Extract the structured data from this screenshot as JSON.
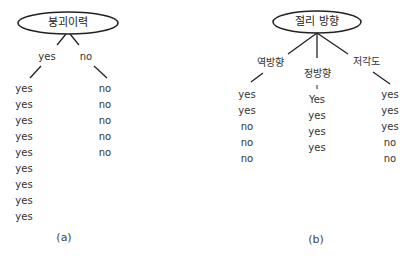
{
  "tree_a": {
    "root": "붕괴이력",
    "branches": [
      {
        "label": "yes",
        "values": [
          "yes",
          "yes",
          "yes",
          "yes",
          "yes",
          "yes",
          "yes",
          "yes",
          "yes"
        ]
      },
      {
        "label": "no",
        "values": [
          "no",
          "no",
          "no",
          "no",
          "no"
        ]
      }
    ],
    "caption": "(a)"
  },
  "tree_b": {
    "root": "절리 방향",
    "branches": [
      {
        "label": "역방향",
        "values": [
          "yes",
          "yes",
          "no",
          "no",
          "no"
        ]
      },
      {
        "label": "정방향",
        "values": [
          "Yes",
          "yes",
          "yes",
          "yes"
        ]
      },
      {
        "label": "저각도",
        "values": [
          "yes",
          "yes",
          "yes",
          "no",
          "no"
        ]
      }
    ],
    "caption": "(b)"
  }
}
